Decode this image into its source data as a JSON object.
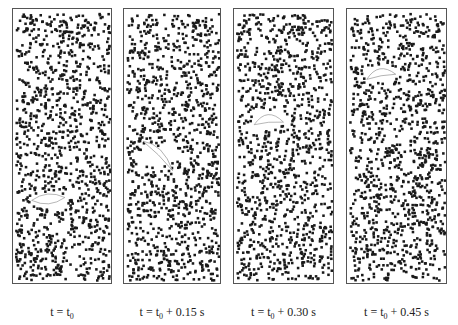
{
  "figure": {
    "panels": [
      {
        "id": "p1",
        "left": 12,
        "width": 100,
        "caption_pre": "t = t",
        "caption_sub": "0",
        "caption_post": "",
        "bubble": {
          "x": 48,
          "y": 200,
          "w": 34,
          "h": 10,
          "rot": -5,
          "shape": "lens"
        }
      },
      {
        "id": "p2",
        "left": 123,
        "width": 98,
        "caption_pre": "t = t",
        "caption_sub": "0",
        "caption_post": " + 0.15 s",
        "bubble": {
          "x": 158,
          "y": 155,
          "w": 40,
          "h": 12,
          "rot": 25,
          "shape": "crescent"
        }
      },
      {
        "id": "p3",
        "left": 233,
        "width": 101,
        "caption_pre": "t = t",
        "caption_sub": "0",
        "caption_post": " + 0.30 s",
        "bubble": {
          "x": 268,
          "y": 117,
          "w": 30,
          "h": 12,
          "rot": -5,
          "shape": "cap"
        }
      },
      {
        "id": "p4",
        "left": 346,
        "width": 101,
        "caption_pre": "t = t",
        "caption_sub": "0",
        "caption_post": " + 0.45 s",
        "bubble": {
          "x": 380,
          "y": 70,
          "w": 30,
          "h": 11,
          "rot": -10,
          "shape": "cap"
        }
      }
    ],
    "particle_color": "#1a1a1a",
    "border_color": "#555555"
  }
}
